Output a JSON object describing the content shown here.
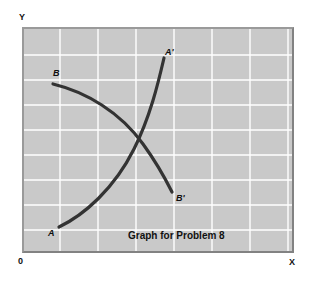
{
  "figure": {
    "caption": "Graph for Problem 8",
    "caption_position": {
      "x": 128,
      "y": 231
    },
    "background_color": "#ffffff",
    "plot_background_color": "#c9c9c9",
    "grid_color": "#ffffff",
    "frame_color": "#8f8f8f",
    "curve_color": "#333333"
  },
  "axes": {
    "y_label": "Y",
    "x_label": "X",
    "origin_label": "0"
  },
  "chart_data": {
    "type": "line",
    "title": "Graph for Problem 8",
    "xlabel": "X",
    "ylabel": "Y",
    "grid": true,
    "legend": "none",
    "axis_origin_label": "0",
    "xlim": [
      0,
      272
    ],
    "ylim": [
      0,
      226
    ],
    "grid_vertical_x": [
      36,
      74,
      112,
      150,
      188,
      226,
      264
    ],
    "grid_horizontal_y": [
      26,
      51,
      76,
      101,
      126,
      151,
      176,
      201
    ],
    "series": [
      {
        "name": "A",
        "start_label": "A",
        "end_label": "A'",
        "description": "upward sloping curve from A to A prime",
        "color": "#333333",
        "path": "M 35 198 C 60 186, 90 160, 110 120 C 126 88, 134 55, 140 29",
        "start_label_position": {
          "x": 24,
          "y": 200
        },
        "end_label_position": {
          "x": 141,
          "y": 19
        },
        "points": [
          {
            "x": 35,
            "y": 198
          },
          {
            "x": 62,
            "y": 183
          },
          {
            "x": 88,
            "y": 160
          },
          {
            "x": 108,
            "y": 126
          },
          {
            "x": 124,
            "y": 88
          },
          {
            "x": 134,
            "y": 56
          },
          {
            "x": 140,
            "y": 29
          }
        ]
      },
      {
        "name": "B",
        "start_label": "B",
        "end_label": "B'",
        "description": "downward sloping curve from B to B prime",
        "color": "#333333",
        "path": "M 29 55 C 62 63, 96 83, 119 115 C 135 137, 144 155, 148 163",
        "start_label_position": {
          "x": 29,
          "y": 40
        },
        "end_label_position": {
          "x": 152,
          "y": 165
        },
        "points": [
          {
            "x": 29,
            "y": 55
          },
          {
            "x": 58,
            "y": 63
          },
          {
            "x": 86,
            "y": 80
          },
          {
            "x": 108,
            "y": 102
          },
          {
            "x": 126,
            "y": 130
          },
          {
            "x": 140,
            "y": 150
          },
          {
            "x": 148,
            "y": 163
          }
        ]
      }
    ],
    "intersection": {
      "x": 113,
      "y": 110
    }
  },
  "labels": {
    "a": "A",
    "a_prime": "A'",
    "b": "B",
    "b_prime": "B'"
  }
}
